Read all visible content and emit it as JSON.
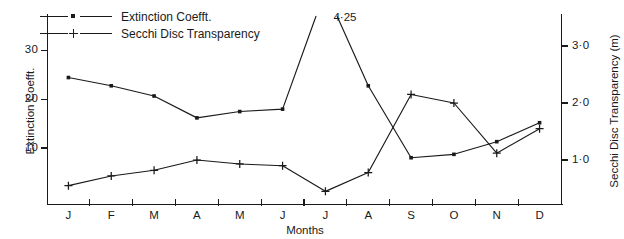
{
  "chart_data": {
    "type": "line",
    "title": "",
    "xlabel": "Months",
    "categories": [
      "J",
      "F",
      "M",
      "A",
      "M",
      "J",
      "J",
      "A",
      "S",
      "O",
      "N",
      "D"
    ],
    "grid": false,
    "legend_position": "top-left",
    "annotations": [
      {
        "text": "4·25",
        "series": "Extinction Coefft.",
        "category": "J",
        "note": "off-scale peak value of extinction coefficient in July"
      }
    ],
    "axes": [
      {
        "id": "left",
        "label": "Extinction Coefft.",
        "ticks": [
          10,
          20,
          30
        ],
        "ticklabels": [
          "10",
          "20",
          "30"
        ],
        "ylim": [
          0,
          34
        ]
      },
      {
        "id": "right",
        "label": "Secchi Disc Transparency (m)",
        "ticks": [
          1.0,
          2.0,
          3.0
        ],
        "ticklabels": [
          "1·0",
          "2·0",
          "3·0"
        ],
        "ylim": [
          0,
          3.35
        ]
      }
    ],
    "series": [
      {
        "name": "Extinction Coefft.",
        "axis": "left",
        "marker": "dot",
        "values": [
          24.5,
          22.8,
          20.7,
          16.2,
          17.5,
          18.0,
          42.5,
          22.8,
          8.0,
          8.7,
          11.3,
          15.2
        ],
        "clipped_at_top": true
      },
      {
        "name": "Secchi Disc Transparency",
        "axis": "right",
        "marker": "plus",
        "values": [
          0.55,
          0.72,
          0.82,
          1.0,
          0.93,
          0.9,
          0.45,
          0.78,
          2.15,
          2.0,
          1.12,
          1.55
        ]
      }
    ]
  },
  "legend": {
    "items": [
      {
        "label": "Extinction Coefft."
      },
      {
        "label": "Secchi Disc Transparency"
      }
    ]
  }
}
